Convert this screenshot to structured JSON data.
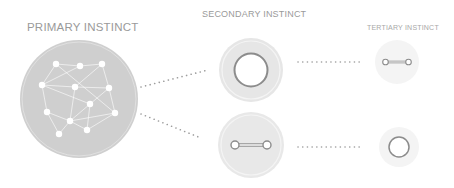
{
  "labels": {
    "primary": "PRIMARY INSTINCT",
    "secondary": "SECONDARY INSTINCT",
    "tertiary": "TERTIARY INSTINCT"
  },
  "colors": {
    "primary_fill": "#cfcfcf",
    "secondary_fill": "#e6e6e6",
    "tertiary_halo": "#f3f3f3",
    "ring_stroke": "#8c8c8c",
    "dots": "#9e9e9e",
    "label_text": "#9a9a9a"
  },
  "nodes": {
    "primary": {
      "shape": "network",
      "node_count": 12
    },
    "secondary": [
      {
        "shape": "ring"
      },
      {
        "shape": "dumbbell"
      }
    ],
    "tertiary": [
      {
        "shape": "dumbbell"
      },
      {
        "shape": "ring"
      }
    ]
  }
}
